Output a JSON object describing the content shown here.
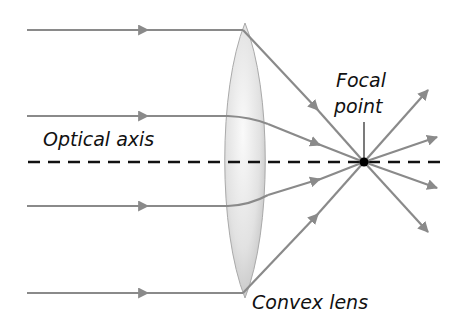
{
  "diagram": {
    "labels": {
      "optical_axis": "Optical axis",
      "focal_point_line1": "Focal",
      "focal_point_line2": "point",
      "lens": "Convex lens"
    },
    "colors": {
      "ray": "#8a8a8a",
      "axis": "#111111",
      "focal_dot": "#000000",
      "lens_fill": "#e4e4e4",
      "lens_edge": "#b0b0b0"
    },
    "incoming_rays_y": [
      30,
      116,
      206,
      293
    ],
    "focal_point": {
      "x": 364,
      "y": 162
    },
    "outgoing_ray_count": 4
  }
}
